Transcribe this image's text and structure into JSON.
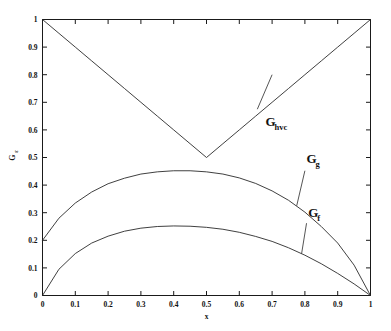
{
  "chart_data": {
    "type": "line",
    "title": "",
    "xlabel": "x",
    "ylabel": "G/ε",
    "xlim": [
      0,
      1
    ],
    "ylim": [
      0,
      1
    ],
    "grid": false,
    "legend_position": "inline-annotations",
    "xticks": [
      "0",
      "0.1",
      "0.2",
      "0.3",
      "0.4",
      "0.5",
      "0.6",
      "0.7",
      "0.8",
      "0.9",
      "1"
    ],
    "xtick_values": [
      0,
      0.1,
      0.2,
      0.3,
      0.4,
      0.5,
      0.6,
      0.7,
      0.8,
      0.9,
      1
    ],
    "yticks": [
      "0",
      "0.1",
      "0.2",
      "0.3",
      "0.4",
      "0.5",
      "0.6",
      "0.7",
      "0.8",
      "0.9",
      "1"
    ],
    "ytick_values": [
      0,
      0.1,
      0.2,
      0.3,
      0.4,
      0.5,
      0.6,
      0.7,
      0.8,
      0.9,
      1
    ],
    "x": [
      0,
      0.05,
      0.1,
      0.15,
      0.2,
      0.25,
      0.3,
      0.35,
      0.4,
      0.45,
      0.5,
      0.55,
      0.6,
      0.65,
      0.7,
      0.75,
      0.8,
      0.85,
      0.9,
      0.95,
      1
    ],
    "series": [
      {
        "name": "G_hvc",
        "label": "G",
        "sublabel": "hvc",
        "values": [
          1.0,
          0.95,
          0.9,
          0.85,
          0.8,
          0.75,
          0.7,
          0.65,
          0.6,
          0.55,
          0.5,
          0.55,
          0.6,
          0.65,
          0.7,
          0.75,
          0.8,
          0.85,
          0.9,
          0.95,
          1.0
        ]
      },
      {
        "name": "G_g",
        "label": "G",
        "sublabel": "g",
        "values": [
          0.2,
          0.28,
          0.335,
          0.375,
          0.405,
          0.425,
          0.44,
          0.448,
          0.452,
          0.452,
          0.448,
          0.44,
          0.426,
          0.406,
          0.379,
          0.345,
          0.302,
          0.25,
          0.19,
          0.11,
          0.0
        ]
      },
      {
        "name": "G_f",
        "label": "G",
        "sublabel": "f",
        "values": [
          0.0,
          0.095,
          0.152,
          0.19,
          0.215,
          0.233,
          0.244,
          0.25,
          0.252,
          0.251,
          0.247,
          0.24,
          0.229,
          0.214,
          0.196,
          0.173,
          0.146,
          0.115,
          0.08,
          0.042,
          0.0
        ]
      }
    ],
    "annotations": [
      {
        "name": "G_hvc",
        "text_main": "G",
        "text_sub": "hvc",
        "x": 0.68,
        "y": 0.615
      },
      {
        "name": "G_g",
        "text_main": "G",
        "text_sub": "g",
        "x": 0.805,
        "y": 0.48
      },
      {
        "name": "G_f",
        "text_main": "G",
        "text_sub": "f",
        "x": 0.81,
        "y": 0.285
      }
    ],
    "ylabel_main": "G",
    "ylabel_sub": "ε"
  },
  "axis": {
    "x_title": "x",
    "y_title_main": "G",
    "y_title_sub": "ε"
  },
  "colors": {
    "curve": "#2a2a2a",
    "frame": "#1a1a1a",
    "text": "#111111",
    "background": "#ffffff"
  }
}
